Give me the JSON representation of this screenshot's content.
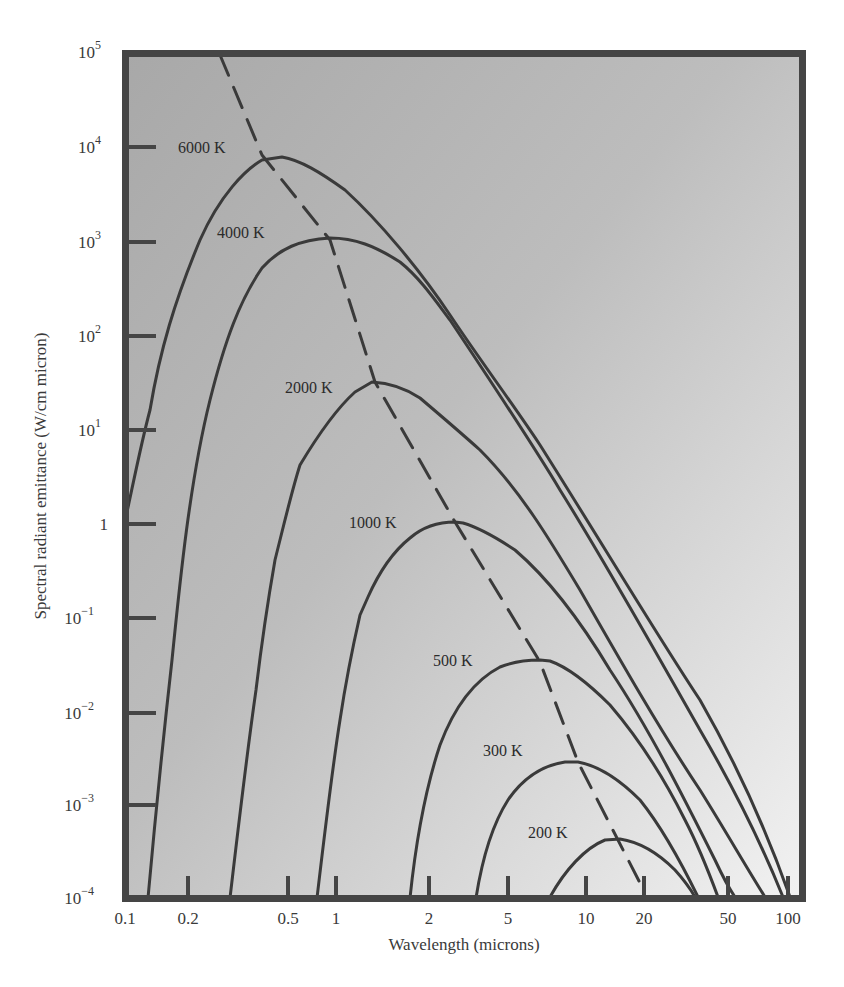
{
  "chart_data": {
    "type": "line",
    "title": "",
    "xlabel": "Wavelength (microns)",
    "ylabel": "Spectral radiant emittance (W/cm micron)",
    "xscale": "log",
    "yscale": "log",
    "xlim": [
      0.1,
      100
    ],
    "ylim": [
      0.0001,
      100000
    ],
    "grid": false,
    "legend": "inline labels",
    "x_ticks": [
      "0.1",
      "0.2",
      "0.5",
      "1",
      "2",
      "5",
      "10",
      "20",
      "50",
      "100"
    ],
    "y_ticks": [
      "10^-4",
      "10^-3",
      "10^-2",
      "10^-1",
      "1",
      "10^1",
      "10^2",
      "10^3",
      "10^4",
      "10^5"
    ],
    "series": [
      {
        "name": "6000 K",
        "peak_wavelength": 0.48,
        "peak_value": 8000
      },
      {
        "name": "4000 K",
        "peak_wavelength": 0.72,
        "peak_value": 1000
      },
      {
        "name": "2000 K",
        "peak_wavelength": 1.45,
        "peak_value": 30
      },
      {
        "name": "1000 K",
        "peak_wavelength": 2.9,
        "peak_value": 1
      },
      {
        "name": "500 K",
        "peak_wavelength": 5.8,
        "peak_value": 0.03
      },
      {
        "name": "300 K",
        "peak_wavelength": 9.7,
        "peak_value": 0.003
      },
      {
        "name": "200 K",
        "peak_wavelength": 14.5,
        "peak_value": 0.0004
      }
    ],
    "annotations": [
      {
        "type": "dashed-line",
        "description": "Wien displacement locus through curve peaks"
      }
    ]
  },
  "axes": {
    "x_label": "Wavelength (microns)",
    "y_label": "Spectral radiant emittance (W/cm micron)",
    "x_ticks": [
      {
        "label": "0.1",
        "px": 125
      },
      {
        "label": "0.2",
        "px": 188
      },
      {
        "label": "0.5",
        "px": 288
      },
      {
        "label": "1",
        "px": 336
      },
      {
        "label": "2",
        "px": 429
      },
      {
        "label": "5",
        "px": 508
      },
      {
        "label": "10",
        "px": 586
      },
      {
        "label": "20",
        "px": 644
      },
      {
        "label": "50",
        "px": 728
      },
      {
        "label": "100",
        "px": 788
      }
    ],
    "y_ticks": [
      {
        "base": "10",
        "exp": "5",
        "py": 52
      },
      {
        "base": "10",
        "exp": "4",
        "py": 147
      },
      {
        "base": "10",
        "exp": "3",
        "py": 242
      },
      {
        "base": "10",
        "exp": "2",
        "py": 336
      },
      {
        "base": "10",
        "exp": "1",
        "py": 430
      },
      {
        "base": "1",
        "exp": "",
        "py": 524
      },
      {
        "base": "10",
        "exp": "−1",
        "py": 618
      },
      {
        "base": "10",
        "exp": "−2",
        "py": 713
      },
      {
        "base": "10",
        "exp": "−3",
        "py": 805
      },
      {
        "base": "10",
        "exp": "−4",
        "py": 898
      }
    ]
  },
  "curve_labels": [
    {
      "text": "6000 K",
      "x": 178,
      "y": 153
    },
    {
      "text": "4000 K",
      "x": 217,
      "y": 238
    },
    {
      "text": "2000 K",
      "x": 285,
      "y": 393
    },
    {
      "text": "1000 K",
      "x": 349,
      "y": 528
    },
    {
      "text": "500 K",
      "x": 433,
      "y": 666
    },
    {
      "text": "300 K",
      "x": 483,
      "y": 756
    },
    {
      "text": "200 K",
      "x": 528,
      "y": 838
    }
  ],
  "colors": {
    "frame": "#444444",
    "curve": "#3c3c3c",
    "bg_top": "#a9a9a9",
    "bg_bottom": "#f0f0f0"
  }
}
